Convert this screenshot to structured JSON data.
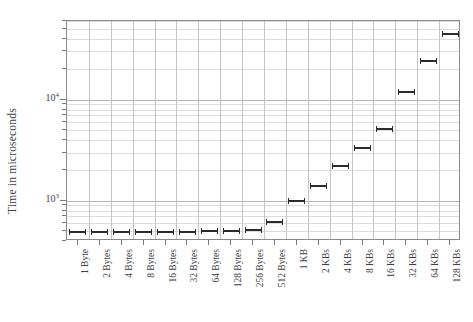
{
  "chart_data": {
    "type": "bar",
    "title": "",
    "subtitle": "",
    "xlabel": "",
    "ylabel": "Time in microseconds",
    "yscale": "log",
    "ylim": [
      400,
      60000
    ],
    "xlim_categories": 18,
    "grid": true,
    "legend": null,
    "marker_style": "horizontal-bar-with-end-caps",
    "series_name": "latency",
    "categories": [
      "1 Byte",
      "2 Bytes",
      "4 Bytes",
      "8 Bytes",
      "16 Bytes",
      "32 Bytes",
      "64 Bytes",
      "128 Bytes",
      "256 Bytes",
      "512 Bytes",
      "1 KB",
      "2 KBs",
      "4 KBs",
      "8 KBs",
      "16 KBs",
      "32 KBs",
      "64 KBs",
      "128 KBs"
    ],
    "values": [
      490,
      490,
      490,
      490,
      492,
      495,
      500,
      505,
      520,
      620,
      990,
      1400,
      2200,
      3300,
      5100,
      12000,
      24000,
      45000
    ],
    "ytick_labels": [
      "10³",
      "10⁴"
    ],
    "ytick_values": [
      1000,
      10000
    ],
    "ytick_exponents": [
      "3",
      "4"
    ],
    "ytick_mantissa": "10"
  },
  "axes": {
    "y_title": "Time in microseconds",
    "y_label_low": "10",
    "y_label_low_exp": "3",
    "y_label_high": "10",
    "y_label_high_exp": "4"
  },
  "colors": {
    "marker": "#2b2b2b",
    "frame": "#8a8a8a",
    "grid_major": "#b4b4b4",
    "grid_minor": "#dcdcdc",
    "text": "#3f3f3f",
    "background": "#ffffff"
  }
}
